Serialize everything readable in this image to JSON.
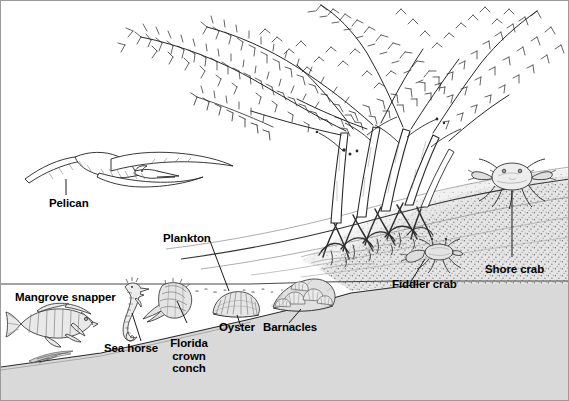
{
  "figure": {
    "style": "pen-and-ink line drawing",
    "ink_color": "#1a1a1a",
    "water_color": "#d9d9d9",
    "sand_color": "#e2e2e2",
    "background_color": "#ffffff",
    "border_color": "#9a9a9a"
  },
  "labels": {
    "pelican": "Pelican",
    "plankton": "Plankton",
    "mangrove_snapper": "Mangrove snapper",
    "sea_horse": "Sea horse",
    "florida_crown_conch": "Florida\ncrown\nconch",
    "oyster": "Oyster",
    "barnacles": "Barnacles",
    "fiddler_crab": "Fiddler crab",
    "shore_crab": "Shore crab"
  },
  "organisms": [
    {
      "name": "Pelican",
      "label": "Pelican",
      "habitat": "air"
    },
    {
      "name": "Plankton",
      "label": "Plankton",
      "habitat": "water column"
    },
    {
      "name": "Mangrove snapper",
      "label": "Mangrove snapper",
      "habitat": "water column"
    },
    {
      "name": "Sea horse",
      "label": "Sea horse",
      "habitat": "shallow water"
    },
    {
      "name": "Florida crown conch",
      "label": "Florida crown conch",
      "habitat": "seafloor"
    },
    {
      "name": "Oyster",
      "label": "Oyster",
      "habitat": "seafloor"
    },
    {
      "name": "Barnacles",
      "label": "Barnacles",
      "habitat": "seafloor / roots"
    },
    {
      "name": "Fiddler crab",
      "label": "Fiddler crab",
      "habitat": "intertidal mud"
    },
    {
      "name": "Shore crab",
      "label": "Shore crab",
      "habitat": "sandy shore"
    }
  ]
}
